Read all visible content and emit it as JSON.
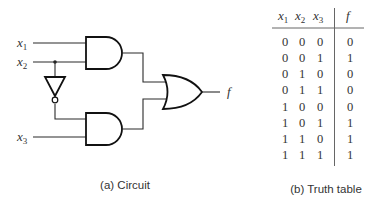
{
  "circuit": {
    "inputs": [
      {
        "name": "x",
        "sub": "1"
      },
      {
        "name": "x",
        "sub": "2"
      },
      {
        "name": "x",
        "sub": "3"
      }
    ],
    "output": "f",
    "gates": [
      "AND",
      "NOT",
      "AND",
      "OR"
    ],
    "caption": "(a) Circuit"
  },
  "truth_table": {
    "headers": [
      {
        "name": "x",
        "sub": "1"
      },
      {
        "name": "x",
        "sub": "2"
      },
      {
        "name": "x",
        "sub": "3"
      },
      {
        "name": "f",
        "sub": ""
      }
    ],
    "rows": [
      [
        "0",
        "0",
        "0",
        "0"
      ],
      [
        "0",
        "0",
        "1",
        "1"
      ],
      [
        "0",
        "1",
        "0",
        "0"
      ],
      [
        "0",
        "1",
        "1",
        "0"
      ],
      [
        "1",
        "0",
        "0",
        "0"
      ],
      [
        "1",
        "0",
        "1",
        "1"
      ],
      [
        "1",
        "1",
        "0",
        "1"
      ],
      [
        "1",
        "1",
        "1",
        "1"
      ]
    ],
    "caption": "(b) Truth table"
  },
  "colors": {
    "line": "#111111",
    "text": "#333333",
    "background": "#ffffff"
  }
}
